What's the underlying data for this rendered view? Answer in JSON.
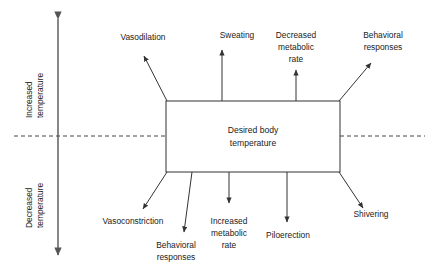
{
  "diagram": {
    "type": "thermoregulation-response-diagram",
    "center_box": {
      "label_line1": "Desired body",
      "label_line2": "temperature"
    },
    "axis": {
      "upper_label_line1": "Increased",
      "upper_label_line2": "temperature",
      "lower_label_line1": "Decreased",
      "lower_label_line2": "temperature",
      "direction": "double-headed-vertical"
    },
    "setpoint_line": {
      "style": "dashed",
      "description": "desired body temperature set point"
    },
    "upper_responses": [
      {
        "id": "vasodilation",
        "label_line1": "Vasodilation",
        "label_line2": ""
      },
      {
        "id": "sweating",
        "label_line1": "Sweating",
        "label_line2": ""
      },
      {
        "id": "decreased-metabolic-rate",
        "label_line1": "Decreased",
        "label_line2": "metabolic",
        "label_line3": "rate"
      },
      {
        "id": "behavioral-responses-upper",
        "label_line1": "Behavioral",
        "label_line2": "responses"
      }
    ],
    "lower_responses": [
      {
        "id": "vasoconstriction",
        "label_line1": "Vasoconstriction",
        "label_line2": ""
      },
      {
        "id": "behavioral-responses-lower",
        "label_line1": "Behavioral",
        "label_line2": "responses"
      },
      {
        "id": "increased-metabolic-rate",
        "label_line1": "Increased",
        "label_line2": "metabolic",
        "label_line3": "rate"
      },
      {
        "id": "piloerection",
        "label_line1": "Piloerection",
        "label_line2": ""
      },
      {
        "id": "shivering",
        "label_line1": "Shivering",
        "label_line2": ""
      }
    ],
    "colors": {
      "stroke": "#333333",
      "text": "#222222",
      "background": "#ffffff",
      "dashed": "#444444"
    }
  }
}
